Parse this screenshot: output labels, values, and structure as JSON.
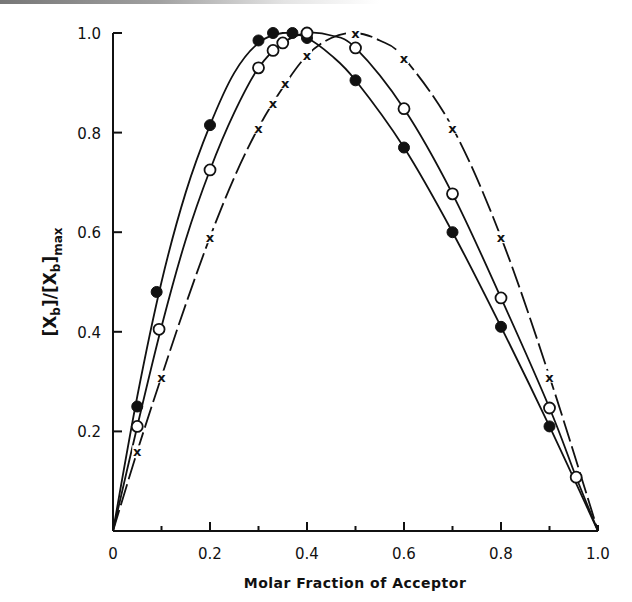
{
  "chart_data": {
    "type": "line",
    "title": "",
    "xlabel": "Molar Fraction of Acceptor",
    "ylabel": "[Xb]/[Xb]max",
    "ylabel_parts": {
      "open": "[X",
      "sub1": "b",
      "mid": "]/[X",
      "sub2": "b",
      "close": "]",
      "sub3": "max"
    },
    "xlim": [
      0,
      1.0
    ],
    "ylim": [
      0,
      1.0
    ],
    "x_ticks_major": [
      0,
      0.2,
      0.4,
      0.6,
      0.8,
      1.0
    ],
    "x_tick_labels": [
      "0",
      "0.2",
      "0.4",
      "0.6",
      "0.8",
      "1.0"
    ],
    "x_ticks_minor": [
      0.1,
      0.3,
      0.5,
      0.7,
      0.9
    ],
    "y_ticks": [
      0.2,
      0.4,
      0.6,
      0.8,
      1.0
    ],
    "y_tick_labels": [
      "0.2",
      "0.4",
      "0.6",
      "0.8",
      "1.0"
    ],
    "grid": false,
    "legend": null,
    "series": [
      {
        "name": "filled circles",
        "marker": "filled-circle",
        "line": "solid",
        "x": [
          0.05,
          0.09,
          0.2,
          0.3,
          0.33,
          0.37,
          0.4,
          0.5,
          0.6,
          0.7,
          0.8,
          0.9
        ],
        "y": [
          0.25,
          0.48,
          0.815,
          0.985,
          1.0,
          1.0,
          0.99,
          0.905,
          0.77,
          0.6,
          0.41,
          0.21
        ],
        "curve": [
          [
            0,
            0
          ],
          [
            0.05,
            0.27
          ],
          [
            0.1,
            0.5
          ],
          [
            0.15,
            0.68
          ],
          [
            0.2,
            0.815
          ],
          [
            0.25,
            0.92
          ],
          [
            0.3,
            0.98
          ],
          [
            0.35,
            1.0
          ],
          [
            0.4,
            0.99
          ],
          [
            0.45,
            0.955
          ],
          [
            0.5,
            0.905
          ],
          [
            0.6,
            0.77
          ],
          [
            0.7,
            0.6
          ],
          [
            0.8,
            0.41
          ],
          [
            0.9,
            0.21
          ],
          [
            1.0,
            0
          ]
        ]
      },
      {
        "name": "open circles",
        "marker": "open-circle",
        "line": "solid",
        "x": [
          0.05,
          0.095,
          0.2,
          0.3,
          0.33,
          0.35,
          0.4,
          0.5,
          0.6,
          0.7,
          0.8,
          0.9,
          0.955
        ],
        "y": [
          0.21,
          0.405,
          0.725,
          0.93,
          0.965,
          0.98,
          1.0,
          0.97,
          0.848,
          0.677,
          0.468,
          0.247,
          0.108
        ],
        "curve": [
          [
            0,
            0
          ],
          [
            0.05,
            0.21
          ],
          [
            0.1,
            0.41
          ],
          [
            0.15,
            0.585
          ],
          [
            0.2,
            0.725
          ],
          [
            0.25,
            0.84
          ],
          [
            0.3,
            0.93
          ],
          [
            0.35,
            0.98
          ],
          [
            0.4,
            1.0
          ],
          [
            0.45,
            0.995
          ],
          [
            0.5,
            0.97
          ],
          [
            0.6,
            0.848
          ],
          [
            0.7,
            0.677
          ],
          [
            0.8,
            0.468
          ],
          [
            0.9,
            0.247
          ],
          [
            0.955,
            0.108
          ],
          [
            1.0,
            0
          ]
        ]
      },
      {
        "name": "crosses",
        "marker": "x",
        "line": "dashed-broken",
        "x": [
          0.05,
          0.1,
          0.2,
          0.3,
          0.33,
          0.355,
          0.4,
          0.5,
          0.6,
          0.7,
          0.8,
          0.9
        ],
        "y": [
          0.16,
          0.31,
          0.59,
          0.81,
          0.86,
          0.9,
          0.955,
          1.0,
          0.95,
          0.81,
          0.59,
          0.31
        ],
        "curve": [
          [
            0,
            0
          ],
          [
            0.05,
            0.16
          ],
          [
            0.1,
            0.31
          ],
          [
            0.15,
            0.455
          ],
          [
            0.2,
            0.59
          ],
          [
            0.25,
            0.71
          ],
          [
            0.3,
            0.81
          ],
          [
            0.35,
            0.89
          ],
          [
            0.4,
            0.955
          ],
          [
            0.45,
            0.99
          ],
          [
            0.5,
            1.0
          ],
          [
            0.55,
            0.985
          ],
          [
            0.6,
            0.95
          ],
          [
            0.7,
            0.81
          ],
          [
            0.8,
            0.59
          ],
          [
            0.9,
            0.31
          ],
          [
            1.0,
            0
          ]
        ]
      }
    ]
  }
}
